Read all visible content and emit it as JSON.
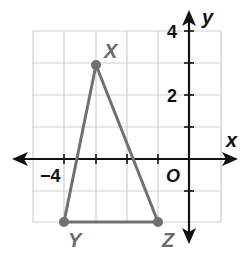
{
  "figure": {
    "type": "coordinate-plane-triangle",
    "axes": {
      "x_label": "x",
      "y_label": "y",
      "origin_label": "O",
      "x_tick_label": "−4",
      "y_tick_labels": [
        "4",
        "2"
      ],
      "x_range": [
        -5,
        1
      ],
      "y_range": [
        -2,
        4
      ],
      "grid": true
    },
    "points": [
      {
        "label": "X",
        "x": -3,
        "y": 3
      },
      {
        "label": "Y",
        "x": -4,
        "y": -2
      },
      {
        "label": "Z",
        "x": -1,
        "y": -2
      }
    ],
    "colors": {
      "grid": "#cfcfcf",
      "axis": "#111111",
      "triangle": "#707070",
      "point_label": "#6a6a6a"
    }
  }
}
